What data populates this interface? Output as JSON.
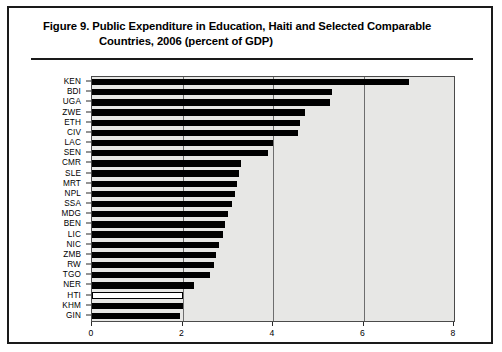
{
  "figure": {
    "label": "Figure 9.",
    "title_line_1": "Figure 9.  Public Expenditure in Education, Haiti and Selected Comparable",
    "title_line_2": "Countries, 2006 (percent of GDP)"
  },
  "colors": {
    "bar_fill": "#000000",
    "bar_highlight_fill": "#ffffff",
    "bar_highlight_stroke": "#000000",
    "plot_background": "#e7e7e5",
    "plot_border": "#4a4a4a",
    "gridline": "#6e6e6e",
    "frame": "#1a1a1a",
    "text": "#000000"
  },
  "chart_data": {
    "type": "bar",
    "orientation": "horizontal",
    "title": "Figure 9.  Public Expenditure in Education, Haiti and Selected Comparable Countries, 2006 (percent of GDP)",
    "xlabel": "",
    "ylabel": "",
    "xlim": [
      0,
      8
    ],
    "ylim": null,
    "xticks": [
      0,
      2,
      4,
      6,
      8
    ],
    "xticklabels": [
      "0",
      "2",
      "4",
      "6",
      "8"
    ],
    "grid": true,
    "grid_axis": "x",
    "legend": false,
    "highlight": "HTI",
    "categories": [
      "KEN",
      "BDI",
      "UGA",
      "ZWE",
      "ETH",
      "CIV",
      "LAC",
      "SEN",
      "CMR",
      "SLE",
      "MRT",
      "NPL",
      "SSA",
      "MDG",
      "BEN",
      "LIC",
      "NIC",
      "ZMB",
      "RW",
      "TGO",
      "NER",
      "HTI",
      "KHM",
      "GIN"
    ],
    "values": [
      7.0,
      5.3,
      5.25,
      4.7,
      4.6,
      4.55,
      4.0,
      3.9,
      3.3,
      3.25,
      3.2,
      3.15,
      3.1,
      3.0,
      2.95,
      2.9,
      2.8,
      2.75,
      2.7,
      2.6,
      2.25,
      2.0,
      2.0,
      1.95
    ],
    "series": [
      {
        "name": "Public expenditure on education (percent of GDP), 2006",
        "values": [
          7.0,
          5.3,
          5.25,
          4.7,
          4.6,
          4.55,
          4.0,
          3.9,
          3.3,
          3.25,
          3.2,
          3.15,
          3.1,
          3.0,
          2.95,
          2.9,
          2.8,
          2.75,
          2.7,
          2.6,
          2.25,
          2.0,
          2.0,
          1.95
        ]
      }
    ]
  }
}
